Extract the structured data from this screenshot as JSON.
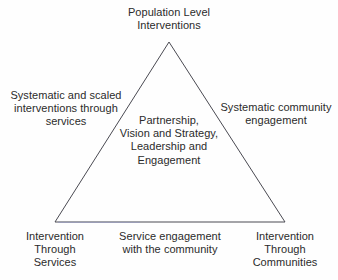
{
  "diagram": {
    "background_color": "#fefefe",
    "stroke_color": "#4a4a52",
    "text_color": "#2b2b2b",
    "shape": {
      "name": "triangle",
      "apex": [
        169,
        42
      ],
      "bottom_left": [
        55,
        222
      ],
      "bottom_right": [
        285,
        222
      ]
    },
    "labels": {
      "apex": "Population Level\nInterventions",
      "left_side": "Systematic and scaled\ninterventions through\nservices",
      "right_side": "Systematic community\nengagement",
      "center": "Partnership,\nVision and Strategy,\nLeadership and\nEngagement",
      "bottom_left": "Intervention\nThrough\nServices",
      "bottom_center": "Service engagement\nwith the community",
      "bottom_right": "Intervention\nThrough\nCommunities"
    }
  }
}
